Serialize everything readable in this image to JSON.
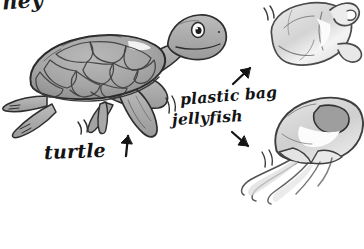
{
  "illustration": {
    "title": "Sea turtle mistaking a plastic bag for a jellyfish",
    "medium": "hand-drawn pencil and ink sketch, grayscale",
    "background_color": "#ffffff",
    "ink_color": "#2b2b2b",
    "shell_fill": "#a8a8a8",
    "skin_fill": "#b5b5b5",
    "bag_fill": "#e2e2e2",
    "jelly_fill": "#d8d8d8"
  },
  "labels": {
    "turtle": "turtle",
    "plastic_bag": "plastic bag",
    "jellyfish": "jellyfish",
    "cropped_top_text": "ney"
  },
  "arrows": {
    "turtle_arrow": "arrow-up",
    "bag_arrow": "arrow-up-right",
    "jelly_arrow": "arrow-down-right"
  },
  "subjects": [
    {
      "name": "turtle",
      "position": "left-center",
      "facing": "right"
    },
    {
      "name": "plastic-bag",
      "position": "top-right"
    },
    {
      "name": "jellyfish",
      "position": "bottom-right"
    }
  ],
  "motion_marks": [
    "near-turtle-rear-flipper",
    "near-turtle-tail",
    "left-of-plastic-bag",
    "left-of-jellyfish"
  ]
}
